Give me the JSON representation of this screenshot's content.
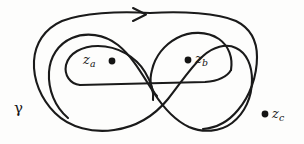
{
  "figure": {
    "type": "complex-contour-winding-diagram",
    "background_color": "#fdfdfc",
    "ink_color": "#141414",
    "width": 304,
    "height": 144
  },
  "labels": {
    "contour": {
      "name": "gamma",
      "text": "γ"
    },
    "point_a": {
      "base": "z",
      "subscript": "a"
    },
    "point_b": {
      "base": "z",
      "subscript": "b"
    },
    "point_c": {
      "base": "z",
      "subscript": "c"
    }
  },
  "points": [
    {
      "id": "za",
      "cx": 112,
      "cy": 61,
      "r": 3.4,
      "inside": true
    },
    {
      "id": "zb",
      "cx": 188,
      "cy": 60,
      "r": 3.4,
      "inside": true
    },
    {
      "id": "zc",
      "cx": 265,
      "cy": 114,
      "r": 3.4,
      "inside": false
    }
  ],
  "orientation": {
    "arrow_direction": "right",
    "arrow_x": 140,
    "arrow_y": 15
  },
  "geometry": {
    "outer_loop": "M 148 14 C 110 12 70 14 52 24 C 36 33 32 48 34 64 C 36 82 46 100 62 114 C 80 129 108 134 130 126 C 146 120 156 108 160 94 C 164 78 162 62 166 48 C 170 34 182 26 196 28 C 210 30 218 42 220 58 C 222 76 216 94 204 108 C 192 122 172 130 156 126 C 140 122 128 110 122 96 C 114 78 110 58 100 44 C 90 31 74 28 62 34",
    "outer_right": "M 148 14 C 186 12 222 14 238 24 C 252 33 256 48 254 66 C 252 86 244 106 230 118 C 218 128 200 130 186 124",
    "inner_left_loop": "M 78 86 C 70 86 64 78 66 68 C 68 56 80 48 96 47 C 116 46 134 56 142 70 C 148 80 150 90 148 98",
    "inner_bridge": "M 78 86 L 200 84 C 214 83 224 80 228 74"
  }
}
